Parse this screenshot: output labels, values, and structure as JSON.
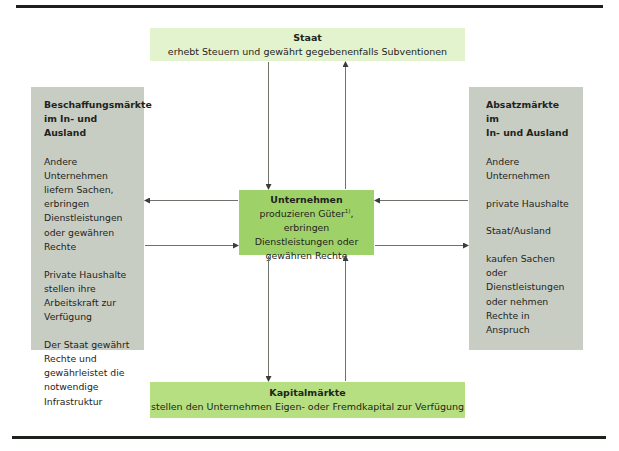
{
  "diagram": {
    "state": {
      "title": "Staat",
      "text": "erhebt Steuern und gewährt gegebenenfalls Subventionen"
    },
    "procurement_markets": {
      "title_line1": "Beschaffungsmärkte",
      "title_line2": "im In- und Ausland",
      "paragraphs": [
        [
          "Andere Unternehmen",
          "liefern Sachen,",
          "erbringen",
          "Dienstleistungen",
          "oder gewähren Rechte"
        ],
        [
          "Private Haushalte",
          "stellen ihre",
          "Arbeitskraft zur",
          "Verfügung"
        ],
        [
          "Der Staat gewährt",
          "Rechte und",
          "gewährleistet die",
          "notwendige",
          "Infrastruktur"
        ]
      ]
    },
    "sales_markets": {
      "title_line1": "Absatzmärkte im",
      "title_line2": "In- und Ausland",
      "paragraphs": [
        [
          "Andere",
          "Unternehmen"
        ],
        [
          "private Haushalte"
        ],
        [
          "Staat/Ausland"
        ],
        [
          "kaufen Sachen oder",
          "Dienstleistungen",
          "oder nehmen",
          "Rechte in Anspruch"
        ]
      ]
    },
    "company": {
      "title": "Unternehmen",
      "line1_pre": "produzieren Güter",
      "footnote": "1)",
      "line1_post": ", erbringen",
      "line2": "Dienstleistungen oder",
      "line3": "gewähren Rechte"
    },
    "capital_markets": {
      "title": "Kapitalmärkte",
      "text": "stellen den Unternehmen Eigen- oder Fremdkapital zur Verfügung"
    },
    "colors": {
      "state_box": "#e3f3cd",
      "company_box": "#9ed269",
      "capital_box": "#b5df80",
      "market_boxes": "#c8cdc3",
      "arrows": "#3a3d38",
      "rules": "#1d211c"
    },
    "arrows": [
      {
        "from": "state",
        "to": "company"
      },
      {
        "from": "company",
        "to": "state"
      },
      {
        "from": "company",
        "to": "procurement_markets"
      },
      {
        "from": "procurement_markets",
        "to": "company"
      },
      {
        "from": "sales_markets",
        "to": "company"
      },
      {
        "from": "company",
        "to": "sales_markets"
      },
      {
        "from": "capital_markets",
        "to": "company"
      },
      {
        "from": "company",
        "to": "capital_markets"
      }
    ]
  }
}
